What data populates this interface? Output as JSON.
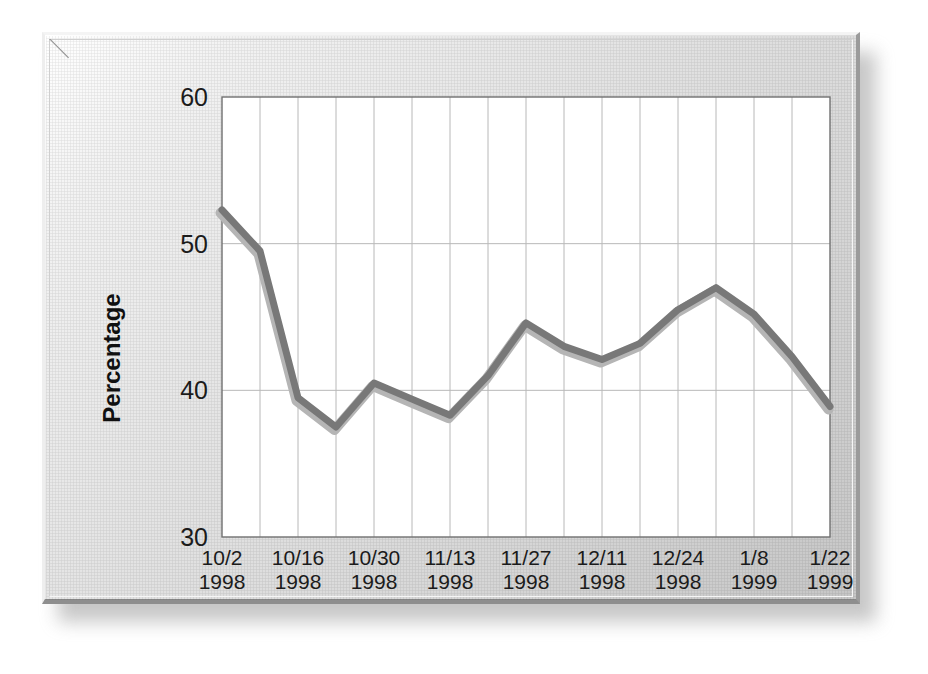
{
  "panel": {
    "frame_style": "beveled-3d-plaque",
    "face_color": "#dedede",
    "shadow_color": "#9a9a9a"
  },
  "chart_data": {
    "type": "line",
    "title": "",
    "subtitle": "",
    "xlabel": "",
    "ylabel": "Percentage",
    "ylim": [
      30,
      60
    ],
    "ytick_values": [
      30,
      40,
      50,
      60
    ],
    "ytick_labels": [
      "30",
      "40",
      "50",
      "60"
    ],
    "grid": true,
    "grid_color": "#b8b8b8",
    "legend": false,
    "legend_position": "none",
    "plot_background": "#ffffff",
    "x": [
      "10/2 1998",
      "10/9 1998",
      "10/16 1998",
      "10/23 1998",
      "10/30 1998",
      "11/6 1998",
      "11/13 1998",
      "11/20 1998",
      "11/27 1998",
      "12/4 1998",
      "12/11 1998",
      "12/18 1998",
      "12/24 1998",
      "1/1 1999",
      "1/8 1999",
      "1/15 1999",
      "1/22 1999"
    ],
    "xtick_labels": [
      {
        "line1": "10/2",
        "line2": "1998",
        "index": 0
      },
      {
        "line1": "10/16",
        "line2": "1998",
        "index": 2
      },
      {
        "line1": "10/30",
        "line2": "1998",
        "index": 4
      },
      {
        "line1": "11/13",
        "line2": "1998",
        "index": 6
      },
      {
        "line1": "11/27",
        "line2": "1998",
        "index": 8
      },
      {
        "line1": "12/11",
        "line2": "1998",
        "index": 10
      },
      {
        "line1": "12/24",
        "line2": "1998",
        "index": 12
      },
      {
        "line1": "1/8",
        "line2": "1999",
        "index": 14
      },
      {
        "line1": "1/22",
        "line2": "1999",
        "index": 16
      }
    ],
    "series": [
      {
        "name": "Percentage",
        "color": "#787878",
        "shadow_color": "#b5b5b5",
        "line_width": 7,
        "values": [
          52.3,
          49.5,
          39.5,
          37.5,
          40.5,
          39.4,
          38.3,
          41.0,
          44.6,
          43.0,
          42.1,
          43.2,
          45.5,
          47.0,
          45.2,
          42.3,
          38.9
        ]
      }
    ]
  }
}
